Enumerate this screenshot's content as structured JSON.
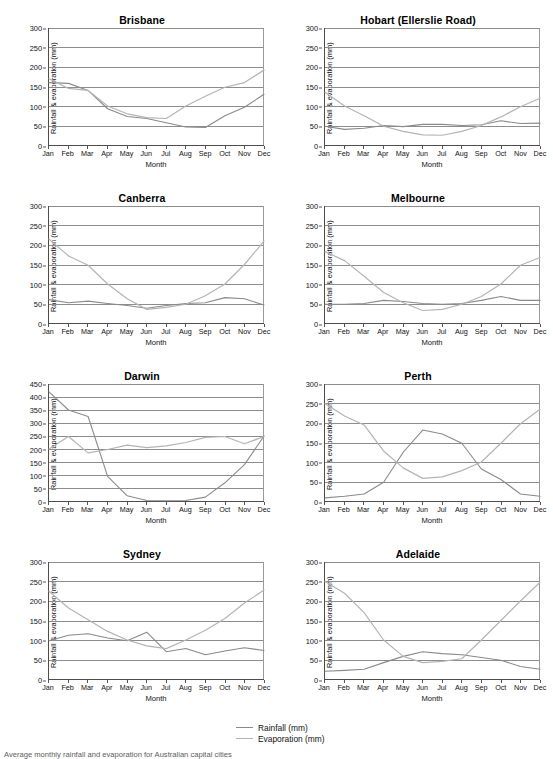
{
  "figure": {
    "legend": {
      "rainfall_label": "Rainfall (mm)",
      "evaporation_label": "Evaporation (mm)",
      "rainfall_color": "#8a8a8a",
      "evaporation_color": "#b4b4b4"
    },
    "caption": "Average monthly rainfall and evaporation for Australian capital cities",
    "shared": {
      "xlabel": "Month",
      "ylabel": "Rainfall & evaporation (mm)",
      "months": [
        "Jan",
        "Feb",
        "Mar",
        "Apr",
        "May",
        "Jun",
        "Jul",
        "Aug",
        "Sep",
        "Oct",
        "Nov",
        "Dec"
      ]
    }
  },
  "chart_data": [
    {
      "type": "line",
      "title": "Brisbane",
      "xlabel": "Month",
      "ylabel": "Rainfall & evaporation (mm)",
      "categories": [
        "Jan",
        "Feb",
        "Mar",
        "Apr",
        "May",
        "Jun",
        "Jul",
        "Aug",
        "Sep",
        "Oct",
        "Nov",
        "Dec"
      ],
      "ylim": [
        0,
        300
      ],
      "yticks": [
        0,
        50,
        100,
        150,
        200,
        250,
        300
      ],
      "grid": true,
      "legend_position": "figure-bottom",
      "series": [
        {
          "name": "Rainfall (mm)",
          "values": [
            160,
            158,
            140,
            93,
            73,
            68,
            57,
            46,
            45,
            75,
            97,
            130
          ]
        },
        {
          "name": "Evaporation (mm)",
          "values": [
            170,
            145,
            140,
            100,
            80,
            70,
            68,
            100,
            125,
            148,
            160,
            192
          ]
        }
      ]
    },
    {
      "type": "line",
      "title": "Hobart (Ellerslie Road)",
      "xlabel": "Month",
      "ylabel": "Rainfall & evaporation (mm)",
      "categories": [
        "Jan",
        "Feb",
        "Mar",
        "Apr",
        "May",
        "Jun",
        "Jul",
        "Aug",
        "Sep",
        "Oct",
        "Nov",
        "Dec"
      ],
      "ylim": [
        0,
        300
      ],
      "yticks": [
        0,
        50,
        100,
        150,
        200,
        250,
        300
      ],
      "grid": true,
      "legend_position": "figure-bottom",
      "series": [
        {
          "name": "Rainfall (mm)",
          "values": [
            48,
            40,
            43,
            50,
            47,
            53,
            53,
            50,
            52,
            62,
            55,
            56
          ]
        },
        {
          "name": "Evaporation (mm)",
          "values": [
            135,
            100,
            75,
            48,
            35,
            26,
            25,
            35,
            50,
            72,
            98,
            120
          ]
        }
      ]
    },
    {
      "type": "line",
      "title": "Canberra",
      "xlabel": "Month",
      "ylabel": "Rainfall & evaporation (mm)",
      "categories": [
        "Jan",
        "Feb",
        "Mar",
        "Apr",
        "May",
        "Jun",
        "Jul",
        "Aug",
        "Sep",
        "Oct",
        "Nov",
        "Dec"
      ],
      "ylim": [
        0,
        300
      ],
      "yticks": [
        0,
        50,
        100,
        150,
        200,
        250,
        300
      ],
      "grid": true,
      "legend_position": "figure-bottom",
      "series": [
        {
          "name": "Rainfall (mm)",
          "values": [
            60,
            52,
            56,
            50,
            45,
            38,
            45,
            50,
            52,
            65,
            62,
            46
          ]
        },
        {
          "name": "Evaporation (mm)",
          "values": [
            215,
            172,
            148,
            100,
            62,
            35,
            40,
            48,
            70,
            100,
            150,
            210
          ]
        }
      ]
    },
    {
      "type": "line",
      "title": "Melbourne",
      "xlabel": "Month",
      "ylabel": "Rainfall & evaporation (mm)",
      "categories": [
        "Jan",
        "Feb",
        "Mar",
        "Apr",
        "May",
        "Jun",
        "Jul",
        "Aug",
        "Sep",
        "Oct",
        "Nov",
        "Dec"
      ],
      "ylim": [
        0,
        300
      ],
      "yticks": [
        0,
        50,
        100,
        150,
        200,
        250,
        300
      ],
      "grid": true,
      "legend_position": "figure-bottom",
      "series": [
        {
          "name": "Rainfall (mm)",
          "values": [
            48,
            48,
            50,
            58,
            55,
            50,
            48,
            50,
            58,
            68,
            58,
            58
          ]
        },
        {
          "name": "Evaporation (mm)",
          "values": [
            183,
            160,
            120,
            78,
            52,
            32,
            35,
            48,
            68,
            100,
            148,
            168
          ]
        }
      ]
    },
    {
      "type": "line",
      "title": "Darwin",
      "xlabel": "Month",
      "ylabel": "Rainfall & evaporation (mm)",
      "categories": [
        "Jan",
        "Feb",
        "Mar",
        "Apr",
        "May",
        "Jun",
        "Jul",
        "Aug",
        "Sep",
        "Oct",
        "Nov",
        "Dec"
      ],
      "ylim": [
        0,
        450
      ],
      "yticks": [
        0,
        50,
        100,
        150,
        200,
        250,
        300,
        350,
        400,
        450
      ],
      "grid": true,
      "legend_position": "figure-bottom",
      "series": [
        {
          "name": "Rainfall (mm)",
          "values": [
            420,
            350,
            325,
            95,
            20,
            2,
            1,
            2,
            15,
            70,
            140,
            250
          ]
        },
        {
          "name": "Evaporation (mm)",
          "values": [
            200,
            248,
            185,
            198,
            215,
            205,
            212,
            225,
            245,
            248,
            220,
            248
          ]
        }
      ]
    },
    {
      "type": "line",
      "title": "Perth",
      "xlabel": "Month",
      "ylabel": "Rainfall & evaporation (mm)",
      "categories": [
        "Jan",
        "Feb",
        "Mar",
        "Apr",
        "May",
        "Jun",
        "Jul",
        "Aug",
        "Sep",
        "Oct",
        "Nov",
        "Dec"
      ],
      "ylim": [
        0,
        300
      ],
      "yticks": [
        0,
        50,
        100,
        150,
        200,
        250,
        300
      ],
      "grid": true,
      "legend_position": "figure-bottom",
      "series": [
        {
          "name": "Rainfall (mm)",
          "values": [
            8,
            12,
            18,
            48,
            125,
            182,
            172,
            148,
            82,
            55,
            18,
            12
          ]
        },
        {
          "name": "Evaporation (mm)",
          "values": [
            250,
            218,
            195,
            128,
            85,
            58,
            62,
            78,
            100,
            148,
            198,
            235
          ]
        }
      ]
    },
    {
      "type": "line",
      "title": "Sydney",
      "xlabel": "Month",
      "ylabel": "Rainfall & evaporation (mm)",
      "categories": [
        "Jan",
        "Feb",
        "Mar",
        "Apr",
        "May",
        "Jun",
        "Jul",
        "Aug",
        "Sep",
        "Oct",
        "Nov",
        "Dec"
      ],
      "ylim": [
        0,
        300
      ],
      "yticks": [
        0,
        50,
        100,
        150,
        200,
        250,
        300
      ],
      "grid": true,
      "legend_position": "figure-bottom",
      "series": [
        {
          "name": "Rainfall (mm)",
          "values": [
            98,
            112,
            116,
            105,
            98,
            120,
            70,
            78,
            62,
            72,
            80,
            73
          ]
        },
        {
          "name": "Evaporation (mm)",
          "values": [
            225,
            182,
            152,
            122,
            100,
            85,
            78,
            100,
            125,
            155,
            195,
            228
          ]
        }
      ]
    },
    {
      "type": "line",
      "title": "Adelaide",
      "xlabel": "Month",
      "ylabel": "Rainfall & evaporation (mm)",
      "categories": [
        "Jan",
        "Feb",
        "Mar",
        "Apr",
        "May",
        "Jun",
        "Jul",
        "Aug",
        "Sep",
        "Oct",
        "Nov",
        "Dec"
      ],
      "ylim": [
        0,
        300
      ],
      "yticks": [
        0,
        50,
        100,
        150,
        200,
        250,
        300
      ],
      "grid": true,
      "legend_position": "figure-bottom",
      "series": [
        {
          "name": "Rainfall (mm)",
          "values": [
            20,
            22,
            25,
            42,
            58,
            70,
            65,
            62,
            55,
            48,
            32,
            25
          ]
        },
        {
          "name": "Evaporation (mm)",
          "values": [
            250,
            220,
            170,
            100,
            58,
            42,
            45,
            52,
            100,
            150,
            200,
            248
          ]
        }
      ]
    }
  ]
}
